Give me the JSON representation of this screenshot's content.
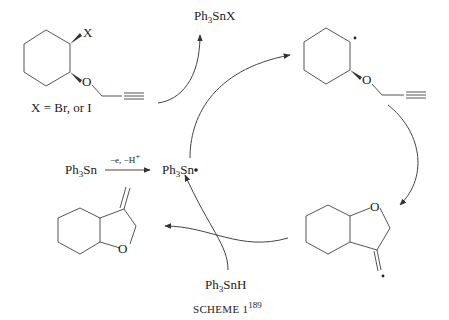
{
  "scheme": {
    "caption": "SCHEME 1",
    "caption_ref": "189"
  },
  "labels": {
    "x_sub": "X",
    "x_def": "X = Br, or I",
    "o": "O",
    "ph3snx": {
      "ph": "Ph",
      "sub": "3",
      "rest": "SnX"
    },
    "ph3sn_reagent": {
      "ph": "Ph",
      "sub": "3",
      "rest": "Sn"
    },
    "ph3sn_radical": {
      "ph": "Ph",
      "sub": "3",
      "rest": "Sn"
    },
    "ph3snh": {
      "ph": "Ph",
      "sub": "3",
      "rest": "SnH"
    },
    "oxidation_cond": "−e, −H",
    "oxidation_sup": "+"
  },
  "structures": [
    {
      "id": "start",
      "description": "trans-2-halocyclohexyl propargyl ether"
    },
    {
      "id": "cyclohexyl-radical",
      "description": "cyclohexyl radical with propargyl ether"
    },
    {
      "id": "vinyl-radical",
      "description": "bicyclic tetrahydrofuran vinyl radical"
    },
    {
      "id": "product",
      "description": "3-methylene hexahydrobenzofuran"
    }
  ]
}
